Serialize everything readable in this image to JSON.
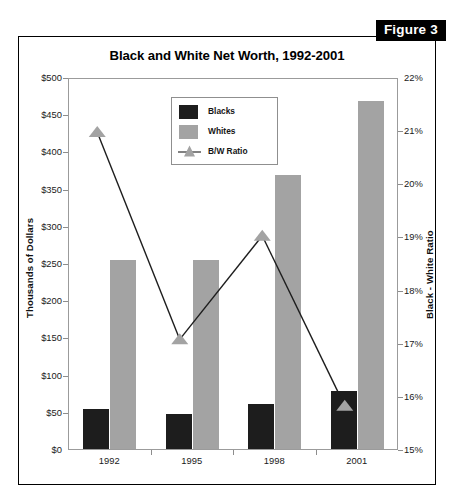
{
  "figure": {
    "badge_label": "Figure 3"
  },
  "chart_data": {
    "type": "bar",
    "title": "Black and White Net Worth, 1992-2001",
    "xlabel": "",
    "ylabel": "Thousands of Dollars",
    "y2label": "Black - White Ratio",
    "categories": [
      "1992",
      "1995",
      "1998",
      "2001"
    ],
    "ylim": [
      0,
      500
    ],
    "y2lim": [
      15,
      22
    ],
    "grid": false,
    "legend_position": "upper-center",
    "y_tick_labels": [
      "$0",
      "$50",
      "$100",
      "$150",
      "$200",
      "$250",
      "$300",
      "$350",
      "$400",
      "$450",
      "$500"
    ],
    "y_tick_values": [
      0,
      50,
      100,
      150,
      200,
      250,
      300,
      350,
      400,
      450,
      500
    ],
    "y2_tick_labels": [
      "15%",
      "16%",
      "17%",
      "18%",
      "19%",
      "20%",
      "21%",
      "22%"
    ],
    "y2_tick_values": [
      15,
      16,
      17,
      18,
      19,
      20,
      21,
      22
    ],
    "series": [
      {
        "name": "Blacks",
        "type": "bar",
        "axis": "left",
        "color": "#1d1d1d",
        "values": [
          54,
          47,
          60,
          78
        ]
      },
      {
        "name": "Whites",
        "type": "bar",
        "axis": "left",
        "color": "#a3a3a3",
        "values": [
          254,
          254,
          368,
          468
        ]
      },
      {
        "name": "B/W Ratio",
        "type": "line",
        "axis": "right",
        "color": "#a3a3a3",
        "line_color": "#1d1d1d",
        "marker": "triangle",
        "values": [
          21.0,
          17.1,
          19.05,
          15.85
        ]
      }
    ]
  },
  "legend": {
    "items": [
      {
        "label": "Blacks"
      },
      {
        "label": "Whites"
      },
      {
        "label": "B/W Ratio"
      }
    ]
  }
}
